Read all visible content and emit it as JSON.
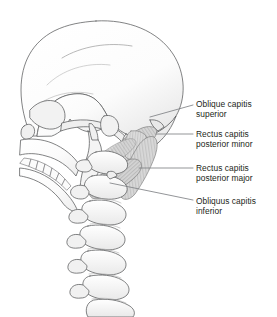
{
  "figure": {
    "background_color": "#ffffff",
    "line_color": "#58595b",
    "text_color": "#231f20",
    "bone_fill": "#fafafa",
    "muscle_fill": "#d8d8d8",
    "leader_color": "#808285"
  },
  "labels": [
    {
      "id": "oblique-capitis-superior",
      "line1": "Oblique capitis",
      "line2": "superior",
      "x": 196,
      "y": 99,
      "leader": {
        "x1": 193,
        "y1": 105,
        "x2": 150,
        "y2": 117
      }
    },
    {
      "id": "rectus-capitis-posterior-minor",
      "line1": "Rectus capitis",
      "line2": "posterior minor",
      "x": 196,
      "y": 129,
      "leader": {
        "x1": 193,
        "y1": 134,
        "x2": 156,
        "y2": 134
      }
    },
    {
      "id": "rectus-capitis-posterior-major",
      "line1": "Rectus capitis",
      "line2": "posterior major",
      "x": 196,
      "y": 163,
      "leader": {
        "x1": 193,
        "y1": 168,
        "x2": 139,
        "y2": 168
      }
    },
    {
      "id": "obliquus-capitis-inferior",
      "line1": "Obliquus capitis",
      "line2": "inferior",
      "x": 196,
      "y": 196,
      "leader": {
        "x1": 193,
        "y1": 200,
        "x2": 110,
        "y2": 183
      }
    }
  ],
  "anatomy": {
    "parts": [
      {
        "name": "cranium",
        "label": "Cranial vault"
      },
      {
        "name": "facial-skeleton",
        "label": "Facial skeleton"
      },
      {
        "name": "maxillary-teeth",
        "label": "Maxillary teeth"
      },
      {
        "name": "mandible",
        "label": "Mandible"
      },
      {
        "name": "occiput",
        "label": "Occipital bone"
      },
      {
        "name": "atlas-c1",
        "label": "Atlas (C1)"
      },
      {
        "name": "axis-c2",
        "label": "Axis (C2)"
      },
      {
        "name": "vertebra-c3",
        "label": "C3 vertebra"
      },
      {
        "name": "vertebra-c4",
        "label": "C4 vertebra"
      },
      {
        "name": "vertebra-c5",
        "label": "C5 vertebra"
      },
      {
        "name": "vertebra-c6",
        "label": "C6 vertebra"
      },
      {
        "name": "vertebra-c7",
        "label": "C7 vertebra"
      },
      {
        "name": "muscle-oblique-capitis-superior",
        "label": "Oblique capitis superior muscle"
      },
      {
        "name": "muscle-rectus-capitis-posterior-minor",
        "label": "Rectus capitis posterior minor muscle"
      },
      {
        "name": "muscle-rectus-capitis-posterior-major",
        "label": "Rectus capitis posterior major muscle"
      },
      {
        "name": "muscle-obliquus-capitis-inferior",
        "label": "Obliquus capitis inferior muscle"
      }
    ]
  }
}
